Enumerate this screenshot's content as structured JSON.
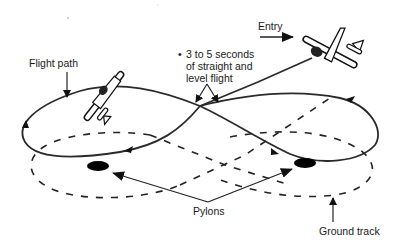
{
  "diagram": {
    "labels": {
      "flight_path": "Flight path",
      "entry": "Entry",
      "note_bullet": "•",
      "note_line1": "3 to 5 seconds",
      "note_line2": "of straight and",
      "note_line3": "level flight",
      "pylons": "Pylons",
      "ground_track": "Ground track"
    },
    "elements": {
      "airplanes": [
        "entry-airplane",
        "left-loop-airplane"
      ],
      "pylons_count": 2,
      "flight_path_shape": "figure-eight",
      "ground_track_shape": "dashed figure-eight of two ellipses"
    },
    "colors": {
      "line": "#222222",
      "background": "#ffffff",
      "pylon": "#000000"
    }
  }
}
